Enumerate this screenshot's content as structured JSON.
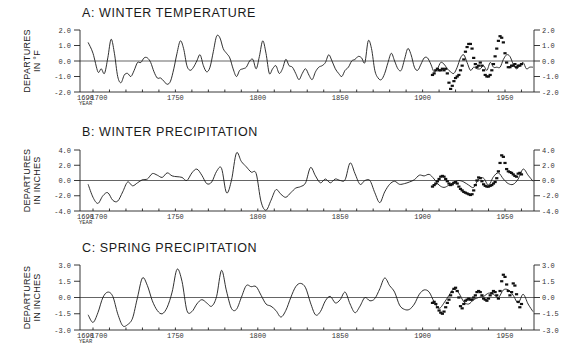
{
  "figure": {
    "x_axis": {
      "start_label": "1690",
      "label": "YEAR",
      "ticks": [
        "1700",
        "1750",
        "1800",
        "1850",
        "1900",
        "1950"
      ]
    }
  },
  "chart_data": [
    {
      "id": "A",
      "type": "line",
      "title": "A: WINTER TEMPERATURE",
      "ylabel": [
        "DEPARTURES",
        "IN °F"
      ],
      "xlabel": "YEAR",
      "xlim": [
        1690,
        1967
      ],
      "ylim": [
        -2.0,
        2.0
      ],
      "yticks": [
        "2.0",
        "1.0",
        "0.0",
        "-1.0",
        "-2.0"
      ],
      "grid": false,
      "series": [
        {
          "name": "Reconstructed (tree-ring)",
          "style": "line",
          "x": [
            1697,
            1700,
            1703,
            1705,
            1707,
            1709,
            1711,
            1713,
            1715,
            1717,
            1719,
            1721,
            1723,
            1725,
            1727,
            1729,
            1731,
            1733,
            1735,
            1737,
            1739,
            1741,
            1743,
            1745,
            1747,
            1749,
            1751,
            1753,
            1755,
            1757,
            1759,
            1761,
            1763,
            1765,
            1767,
            1769,
            1771,
            1773,
            1775,
            1777,
            1779,
            1781,
            1783,
            1785,
            1787,
            1789,
            1791,
            1793,
            1795,
            1797,
            1799,
            1801,
            1803,
            1805,
            1807,
            1809,
            1811,
            1813,
            1815,
            1817,
            1819,
            1821,
            1823,
            1825,
            1827,
            1829,
            1831,
            1833,
            1835,
            1837,
            1839,
            1841,
            1843,
            1845,
            1847,
            1849,
            1851,
            1853,
            1855,
            1857,
            1859,
            1861,
            1863,
            1865,
            1867,
            1869,
            1871,
            1873,
            1875,
            1877,
            1879,
            1881,
            1883,
            1885,
            1887,
            1889,
            1891,
            1893,
            1895,
            1897,
            1899,
            1901,
            1903,
            1905,
            1907,
            1909,
            1911,
            1913,
            1915,
            1917,
            1919,
            1921,
            1923,
            1925,
            1927,
            1929,
            1931,
            1933,
            1935,
            1937,
            1939,
            1941,
            1943,
            1945,
            1947,
            1949,
            1951,
            1953,
            1955,
            1957,
            1959,
            1961,
            1963,
            1965,
            1967
          ],
          "values": [
            1.2,
            0.5,
            -0.7,
            -0.5,
            -0.8,
            0.2,
            1.4,
            0.5,
            -1.0,
            -1.4,
            -0.9,
            -0.8,
            -1.0,
            -0.6,
            -0.1,
            -0.1,
            0.2,
            0.2,
            -0.1,
            -0.7,
            -1.1,
            -1.1,
            -1.3,
            -1.5,
            -1.3,
            -0.5,
            0.5,
            1.3,
            0.8,
            -0.3,
            -0.6,
            -0.4,
            0.0,
            0.4,
            -0.3,
            -0.7,
            -0.4,
            0.6,
            1.6,
            1.5,
            0.8,
            0.5,
            0.2,
            -0.5,
            -1.0,
            -0.6,
            -0.5,
            -0.4,
            0.0,
            0.1,
            -0.5,
            0.3,
            1.3,
            0.5,
            -0.8,
            -0.5,
            -0.3,
            -0.8,
            -0.5,
            0.1,
            -0.3,
            -0.4,
            -0.8,
            -1.2,
            -0.8,
            -0.5,
            -0.9,
            -1.2,
            -0.7,
            -0.4,
            -0.3,
            -0.1,
            0.4,
            0.0,
            -0.5,
            -0.8,
            -1.0,
            -0.6,
            -0.4,
            0.0,
            0.1,
            0.3,
            0.2,
            -0.1,
            1.3,
            0.8,
            -0.6,
            -1.1,
            -1.2,
            -0.8,
            -0.1,
            0.5,
            0.0,
            -0.5,
            -0.6,
            0.1,
            0.8,
            0.4,
            -0.4,
            -0.6,
            -0.2,
            0.2,
            0.2,
            -0.2,
            -0.7,
            -0.5,
            -0.1,
            -0.2,
            -0.5,
            -0.7,
            -0.8,
            -0.4,
            0.2,
            0.4,
            -0.1,
            -0.6,
            -0.4,
            -0.5,
            -0.5,
            -0.3,
            -0.6,
            -0.1,
            -0.4,
            -0.4,
            -0.4,
            0.1,
            0.4,
            0.3,
            -0.2,
            -0.5,
            -0.3,
            -0.1,
            -0.5,
            -0.4,
            -0.4
          ]
        },
        {
          "name": "Observed (instrumental)",
          "style": "dashes",
          "x": [
            1906,
            1907,
            1908,
            1909,
            1910,
            1911,
            1912,
            1913,
            1914,
            1915,
            1916,
            1917,
            1918,
            1919,
            1920,
            1921,
            1922,
            1923,
            1924,
            1925,
            1926,
            1927,
            1928,
            1929,
            1930,
            1931,
            1932,
            1933,
            1934,
            1935,
            1936,
            1937,
            1938,
            1939,
            1940,
            1941,
            1942,
            1943,
            1944,
            1945,
            1946,
            1947,
            1948,
            1949,
            1950,
            1951,
            1952,
            1953,
            1954,
            1955,
            1956,
            1957,
            1958,
            1959,
            1960
          ],
          "values": [
            -0.9,
            -0.8,
            -0.6,
            -0.5,
            -0.6,
            -0.6,
            -0.5,
            -0.6,
            -0.5,
            -0.8,
            -1.4,
            -1.8,
            -1.6,
            -1.3,
            -1.1,
            -1.0,
            -0.9,
            -0.6,
            -0.3,
            0.1,
            0.6,
            0.9,
            1.1,
            1.1,
            0.8,
            0.2,
            -0.2,
            -0.4,
            -0.3,
            -0.1,
            -0.3,
            -0.6,
            -0.9,
            -1.0,
            -1.0,
            -0.9,
            -0.6,
            -0.2,
            0.3,
            0.8,
            1.3,
            1.6,
            1.5,
            1.2,
            0.5,
            -0.1,
            -0.4,
            -0.4,
            -0.3,
            -0.3,
            -0.2,
            -0.4,
            -0.3,
            -0.3,
            -0.2
          ]
        }
      ]
    },
    {
      "id": "B",
      "type": "line",
      "title": "B: WINTER PRECIPITATION",
      "ylabel": [
        "DEPARTURES",
        "IN INCHES"
      ],
      "xlabel": "YEAR",
      "xlim": [
        1690,
        1967
      ],
      "ylim": [
        -4.0,
        4.0
      ],
      "yticks": [
        "4.0",
        "2.0",
        "0.0",
        "-2.0",
        "-4.0"
      ],
      "grid": false,
      "series": [
        {
          "name": "Reconstructed (tree-ring)",
          "style": "line",
          "x": [
            1697,
            1700,
            1703,
            1706,
            1709,
            1712,
            1715,
            1718,
            1721,
            1724,
            1727,
            1730,
            1733,
            1736,
            1739,
            1742,
            1745,
            1748,
            1751,
            1754,
            1757,
            1760,
            1763,
            1766,
            1769,
            1772,
            1775,
            1778,
            1781,
            1784,
            1787,
            1790,
            1793,
            1796,
            1799,
            1802,
            1805,
            1808,
            1811,
            1814,
            1817,
            1820,
            1823,
            1826,
            1829,
            1832,
            1835,
            1838,
            1841,
            1844,
            1847,
            1850,
            1853,
            1856,
            1859,
            1862,
            1865,
            1868,
            1871,
            1874,
            1877,
            1880,
            1883,
            1886,
            1889,
            1892,
            1895,
            1898,
            1901,
            1904,
            1907,
            1910,
            1913,
            1916,
            1919,
            1922,
            1925,
            1928,
            1931,
            1934,
            1937,
            1940,
            1943,
            1946,
            1949,
            1952,
            1955,
            1958,
            1961,
            1964,
            1967
          ],
          "values": [
            -0.5,
            -2.2,
            -3.0,
            -2.0,
            -1.6,
            -2.6,
            -2.7,
            -1.5,
            -0.2,
            -0.7,
            -0.3,
            0.1,
            0.2,
            0.9,
            0.7,
            0.4,
            1.0,
            0.6,
            0.5,
            0.4,
            0.0,
            1.0,
            1.5,
            0.7,
            -0.4,
            -0.2,
            1.2,
            1.6,
            -1.6,
            0.0,
            3.6,
            2.5,
            1.8,
            1.1,
            0.9,
            -2.8,
            -3.9,
            -2.6,
            -1.2,
            -1.8,
            -2.2,
            -1.6,
            -1.0,
            -0.8,
            -0.3,
            1.7,
            0.6,
            -0.3,
            0.2,
            -0.3,
            0.2,
            0.0,
            0.1,
            2.3,
            0.9,
            -0.5,
            0.0,
            0.0,
            -1.6,
            -2.9,
            -1.5,
            -0.5,
            -0.1,
            -0.5,
            -0.4,
            -0.2,
            0.1,
            0.7,
            0.6,
            0.8,
            0.2,
            -0.6,
            -0.9,
            -0.6,
            -0.2,
            0.0,
            -0.2,
            -0.6,
            -0.9,
            0.2,
            0.3,
            -0.6,
            0.5,
            1.0,
            0.2,
            -0.4,
            -0.5,
            0.2,
            1.5,
            0.7,
            -0.1
          ]
        },
        {
          "name": "Observed (instrumental)",
          "style": "dashes",
          "x": [
            1906,
            1907,
            1908,
            1909,
            1910,
            1911,
            1912,
            1913,
            1914,
            1915,
            1916,
            1917,
            1918,
            1919,
            1920,
            1921,
            1922,
            1923,
            1924,
            1925,
            1926,
            1927,
            1928,
            1929,
            1930,
            1931,
            1932,
            1933,
            1934,
            1935,
            1936,
            1937,
            1938,
            1939,
            1940,
            1941,
            1942,
            1943,
            1944,
            1945,
            1946,
            1947,
            1948,
            1949,
            1950,
            1951,
            1952,
            1953,
            1954,
            1955,
            1956,
            1957,
            1958,
            1959,
            1960
          ],
          "values": [
            -0.8,
            -0.6,
            -0.4,
            -0.1,
            0.2,
            0.5,
            0.6,
            0.5,
            0.2,
            -0.1,
            -0.4,
            -0.6,
            -0.5,
            -0.3,
            -0.2,
            -0.4,
            -0.8,
            -1.1,
            -1.3,
            -1.5,
            -1.6,
            -1.7,
            -1.8,
            -1.9,
            -1.8,
            -1.3,
            -0.6,
            0.0,
            0.4,
            0.3,
            -0.1,
            -0.5,
            -0.7,
            -0.8,
            -0.8,
            -0.7,
            -0.6,
            -0.4,
            -0.2,
            0.3,
            1.2,
            2.3,
            3.3,
            3.1,
            2.3,
            1.5,
            1.2,
            1.1,
            1.0,
            0.8,
            0.6,
            0.5,
            0.9,
            1.0,
            0.8
          ]
        }
      ]
    },
    {
      "id": "C",
      "type": "line",
      "title": "C: SPRING PRECIPITATION",
      "ylabel": [
        "DEPARTURES",
        "IN INCHES"
      ],
      "xlabel": "YEAR",
      "xlim": [
        1690,
        1967
      ],
      "ylim": [
        -3.0,
        3.0
      ],
      "yticks": [
        "3.0",
        "1.5",
        "0.0",
        "-1.5",
        "-3.0"
      ],
      "grid": false,
      "series": [
        {
          "name": "Reconstructed (tree-ring)",
          "style": "line",
          "x": [
            1697,
            1700,
            1703,
            1706,
            1709,
            1712,
            1715,
            1718,
            1721,
            1724,
            1727,
            1730,
            1733,
            1736,
            1739,
            1742,
            1745,
            1748,
            1751,
            1754,
            1757,
            1760,
            1763,
            1766,
            1769,
            1772,
            1775,
            1778,
            1781,
            1784,
            1787,
            1790,
            1793,
            1796,
            1799,
            1802,
            1805,
            1808,
            1811,
            1814,
            1817,
            1820,
            1823,
            1826,
            1829,
            1832,
            1835,
            1838,
            1841,
            1844,
            1847,
            1850,
            1853,
            1856,
            1859,
            1862,
            1865,
            1868,
            1871,
            1874,
            1877,
            1880,
            1883,
            1886,
            1889,
            1892,
            1895,
            1898,
            1901,
            1904,
            1907,
            1910,
            1913,
            1916,
            1919,
            1922,
            1925,
            1928,
            1931,
            1934,
            1937,
            1940,
            1943,
            1946,
            1949,
            1952,
            1955,
            1958,
            1961,
            1964,
            1967
          ],
          "values": [
            -1.6,
            -2.3,
            -1.4,
            0.0,
            0.5,
            0.1,
            -1.5,
            -2.6,
            -2.5,
            -1.9,
            0.0,
            1.8,
            1.1,
            -0.3,
            -1.2,
            -1.5,
            -0.9,
            0.5,
            2.6,
            1.5,
            -1.2,
            -1.3,
            -0.6,
            -0.2,
            -0.5,
            -0.8,
            0.1,
            2.5,
            0.6,
            -1.0,
            -1.1,
            0.0,
            1.1,
            1.0,
            1.0,
            0.2,
            -0.6,
            -0.8,
            -1.2,
            -1.8,
            -1.2,
            0.0,
            1.0,
            1.3,
            0.9,
            -0.5,
            -1.6,
            -1.3,
            -0.3,
            0.1,
            -0.5,
            -0.2,
            0.5,
            -0.6,
            -1.4,
            -0.8,
            0.0,
            -0.3,
            -0.1,
            0.8,
            1.8,
            1.1,
            0.5,
            -0.7,
            -1.1,
            -1.1,
            -0.6,
            0.3,
            0.7,
            0.5,
            -0.4,
            -1.0,
            -0.5,
            0.2,
            0.8,
            0.4,
            -0.4,
            -0.6,
            -0.2,
            0.0,
            0.1,
            0.4,
            0.3,
            0.0,
            0.7,
            0.7,
            0.2,
            -0.5,
            0.3,
            -0.6,
            -1.3
          ]
        },
        {
          "name": "Observed (instrumental)",
          "style": "dashes",
          "x": [
            1906,
            1907,
            1908,
            1909,
            1910,
            1911,
            1912,
            1913,
            1914,
            1915,
            1916,
            1917,
            1918,
            1919,
            1920,
            1921,
            1922,
            1923,
            1924,
            1925,
            1926,
            1927,
            1928,
            1929,
            1930,
            1931,
            1932,
            1933,
            1934,
            1935,
            1936,
            1937,
            1938,
            1939,
            1940,
            1941,
            1942,
            1943,
            1944,
            1945,
            1946,
            1947,
            1948,
            1949,
            1950,
            1951,
            1952,
            1953,
            1954,
            1955,
            1956,
            1957,
            1958,
            1959,
            1960
          ],
          "values": [
            -0.5,
            -0.4,
            -0.6,
            -0.9,
            -1.2,
            -1.4,
            -1.5,
            -1.3,
            -0.9,
            -0.5,
            -0.2,
            0.2,
            0.5,
            0.8,
            0.9,
            0.6,
            0.0,
            -0.8,
            -1.0,
            -0.6,
            -0.3,
            -0.2,
            -0.1,
            -0.2,
            -0.2,
            0.0,
            0.2,
            0.5,
            0.6,
            0.5,
            0.2,
            -0.1,
            -0.2,
            -0.3,
            -0.1,
            0.2,
            0.4,
            0.6,
            0.5,
            0.2,
            -0.1,
            0.6,
            1.5,
            2.1,
            1.9,
            1.2,
            0.6,
            0.2,
            0.5,
            1.3,
            1.1,
            0.3,
            -0.4,
            -0.9,
            -0.6
          ]
        }
      ]
    }
  ]
}
